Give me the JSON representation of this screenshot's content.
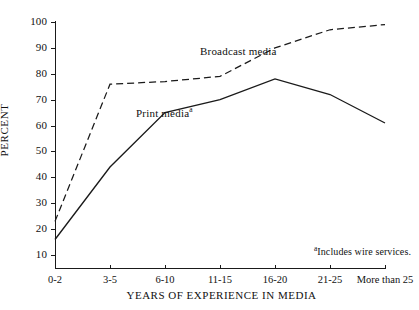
{
  "chart_data": {
    "type": "line",
    "title": "",
    "subtitle": "",
    "xlabel": "YEARS OF EXPERIENCE IN MEDIA",
    "ylabel": "PERCENT",
    "categories": [
      "0-2",
      "3-5",
      "6-10",
      "11-15",
      "16-20",
      "21-25",
      "More than 25"
    ],
    "yticks": [
      10,
      20,
      30,
      40,
      50,
      60,
      70,
      80,
      90,
      100
    ],
    "ylim": [
      5,
      100
    ],
    "grid": false,
    "legend_position": "inline-annotation",
    "series": [
      {
        "name": "Broadcast media",
        "style": "dashed",
        "color": "#1a1a1a",
        "values": [
          23,
          76,
          77,
          79,
          90,
          97,
          99
        ]
      },
      {
        "name": "Print media",
        "style": "solid",
        "color": "#1a1a1a",
        "values": [
          16,
          44,
          65,
          70,
          78,
          72,
          61
        ]
      }
    ],
    "annotations": [
      {
        "id": "broadcast",
        "text": "Broadcast media",
        "marker": ""
      },
      {
        "id": "print",
        "text": "Print media",
        "marker": "a"
      }
    ],
    "footnote": {
      "marker": "a",
      "text": "Includes wire services."
    }
  },
  "axis": {
    "y_title": "PERCENT",
    "x_title": "YEARS OF EXPERIENCE IN MEDIA",
    "y_tick_labels": [
      "100",
      "90",
      "80",
      "70",
      "60",
      "50",
      "40",
      "30",
      "20",
      "10"
    ],
    "x_tick_labels": [
      "0-2",
      "3-5",
      "6-10",
      "11-15",
      "16-20",
      "21-25",
      "More than 25"
    ]
  },
  "labels": {
    "broadcast": "Broadcast media",
    "print": "Print media",
    "print_marker": "a",
    "footnote_marker": "a",
    "footnote_text": "Includes wire services."
  }
}
